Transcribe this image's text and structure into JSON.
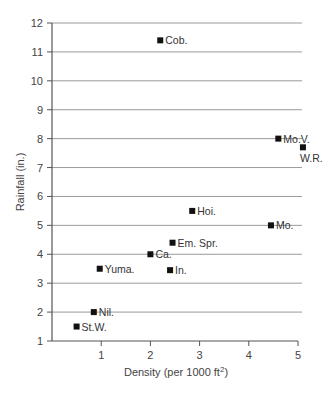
{
  "chart_data": {
    "type": "scatter",
    "title": "",
    "xlabel": "Density (per 1000 ft²)",
    "xlabel_parts": {
      "main": "Density (per 1000 ft",
      "sup": "2",
      "end": ")"
    },
    "ylabel": "Rainfall (in.)",
    "xlim": [
      0,
      5
    ],
    "ylim": [
      1,
      12
    ],
    "xticks": [
      1,
      2,
      3,
      4,
      5
    ],
    "yticks": [
      1,
      2,
      3,
      4,
      5,
      6,
      7,
      8,
      9,
      10,
      11,
      12
    ],
    "grid": {
      "horizontal": true,
      "vertical": false
    },
    "legend": null,
    "points": [
      {
        "label": "Cob.",
        "x": 2.2,
        "y": 11.4,
        "label_pos": "right"
      },
      {
        "label": "Mo.V.",
        "x": 4.6,
        "y": 8.0,
        "label_pos": "right"
      },
      {
        "label": "W.R.",
        "x": 5.1,
        "y": 7.7,
        "label_pos": "below"
      },
      {
        "label": "Hoi.",
        "x": 2.85,
        "y": 5.5,
        "label_pos": "right"
      },
      {
        "label": "Mo.",
        "x": 4.45,
        "y": 5.0,
        "label_pos": "right"
      },
      {
        "label": "Em. Spr.",
        "x": 2.45,
        "y": 4.4,
        "label_pos": "right"
      },
      {
        "label": "Ca.",
        "x": 2.0,
        "y": 4.0,
        "label_pos": "right"
      },
      {
        "label": "In.",
        "x": 2.4,
        "y": 3.45,
        "label_pos": "right"
      },
      {
        "label": "Yuma.",
        "x": 0.97,
        "y": 3.5,
        "label_pos": "right"
      },
      {
        "label": "Nil.",
        "x": 0.85,
        "y": 2.0,
        "label_pos": "right"
      },
      {
        "label": "St.W.",
        "x": 0.5,
        "y": 1.5,
        "label_pos": "right"
      }
    ]
  },
  "colors": {
    "grid": "#9a9a9a",
    "axis": "#555555",
    "marker": "#111111",
    "text": "#333333"
  }
}
